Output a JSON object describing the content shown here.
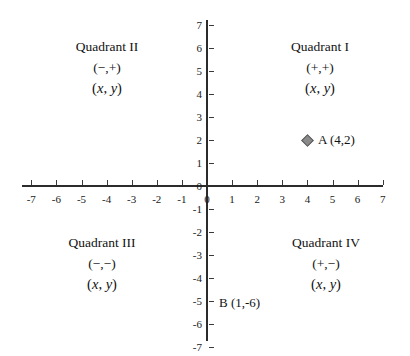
{
  "chart_data": {
    "type": "scatter",
    "title": "",
    "xlabel": "",
    "ylabel": "",
    "xlim": [
      -7,
      7
    ],
    "ylim": [
      -7,
      7
    ],
    "grid": false,
    "legend": "none",
    "x_ticks": [
      "-7",
      "-6",
      "-5",
      "-4",
      "-3",
      "-2",
      "-1",
      "0",
      "1",
      "2",
      "3",
      "4",
      "5",
      "6",
      "7"
    ],
    "y_ticks": [
      "7",
      "6",
      "5",
      "4",
      "3",
      "2",
      "1",
      "0",
      "-1",
      "-2",
      "-3",
      "-4",
      "-5",
      "-6",
      "-7"
    ],
    "points": [
      {
        "name": "A",
        "label": "A (4,2)",
        "x": 4,
        "y": 2,
        "marker": "diamond",
        "color": "#8a8a8a",
        "plotted": true
      },
      {
        "name": "B",
        "label": "B (1,-6)",
        "x": 1,
        "y": -6,
        "marker": "none",
        "color": "#121212",
        "plotted": false
      }
    ],
    "annotations": [
      {
        "id": "quadrant-1",
        "name": "Quadrant I",
        "signs": "(+,+)",
        "coords": "(x, y)",
        "at_x": 4.0,
        "at_y": 5.2
      },
      {
        "id": "quadrant-2",
        "name": "Quadrant II",
        "signs": "(−,+)",
        "coords": "(x, y)",
        "at_x": -3.9,
        "at_y": 5.2
      },
      {
        "id": "quadrant-3",
        "name": "Quadrant III",
        "signs": "(−,−)",
        "coords": "(x, y)",
        "at_x": -4.0,
        "at_y": -2.8
      },
      {
        "id": "quadrant-4",
        "name": "Quadrant IV",
        "signs": "(+,−)",
        "coords": "(x, y)",
        "at_x": 4.3,
        "at_y": -2.8
      }
    ]
  },
  "axes": {
    "x_tick_labels": [
      "-7",
      "-6",
      "-5",
      "-4",
      "-3",
      "-2",
      "-1",
      "0",
      "1",
      "2",
      "3",
      "4",
      "5",
      "6",
      "7"
    ],
    "y_tick_labels": [
      "7",
      "6",
      "5",
      "4",
      "3",
      "2",
      "1",
      "0",
      "-1",
      "-2",
      "-3",
      "-4",
      "-5",
      "-6",
      "-7"
    ],
    "origin_x_label": "0",
    "origin_y_label": "0"
  },
  "quadrants": [
    {
      "name": "Quadrant I",
      "signs": "(+,+)",
      "coords_open": "(",
      "coords_x": "x",
      "coords_sep": ", ",
      "coords_y": "y",
      "coords_close": ")"
    },
    {
      "name": "Quadrant II",
      "signs": "(−,+)",
      "coords_open": "(",
      "coords_x": "x",
      "coords_sep": ", ",
      "coords_y": "y",
      "coords_close": ")"
    },
    {
      "name": "Quadrant III",
      "signs": "(−,−)",
      "coords_open": "(",
      "coords_x": "x",
      "coords_sep": ", ",
      "coords_y": "y",
      "coords_close": ")"
    },
    {
      "name": "Quadrant IV",
      "signs": "(+,−)",
      "coords_open": "(",
      "coords_x": "x",
      "coords_sep": ", ",
      "coords_y": "y",
      "coords_close": ")"
    }
  ],
  "points": {
    "a_label": "A (4,2)",
    "b_label": "B (1,-6)"
  },
  "colors": {
    "axis": "#2b2b2b",
    "text": "#121212",
    "marker_fill": "#8a8a8a",
    "marker_stroke": "#5a5a5a",
    "background": "#ffffff"
  }
}
